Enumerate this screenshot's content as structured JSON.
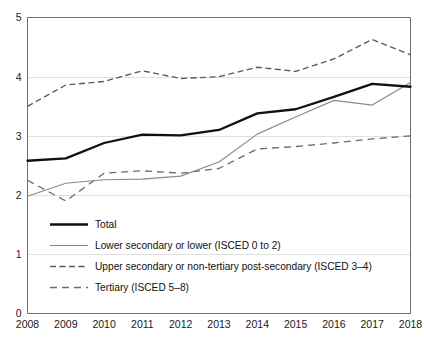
{
  "chart_data": {
    "type": "line",
    "title": "",
    "subtitle": "",
    "xlabel": "",
    "ylabel": "",
    "x": [
      2008,
      2009,
      2010,
      2011,
      2012,
      2013,
      2014,
      2015,
      2016,
      2017,
      2018
    ],
    "xtick_labels": [
      "2008",
      "2009",
      "2010",
      "2011",
      "2012",
      "2013",
      "2014",
      "2015",
      "2016",
      "2017",
      "2018"
    ],
    "ytick_labels": [
      "0",
      "1",
      "2",
      "3",
      "4",
      "5"
    ],
    "yticks": [
      0,
      1,
      2,
      3,
      4,
      5
    ],
    "xlim": [
      2008,
      2018
    ],
    "ylim": [
      0,
      5
    ],
    "grid": "horizontal",
    "legend_position": "lower-left-inside",
    "series": [
      {
        "name": "Total",
        "style": "solid-thick",
        "color": "#111111",
        "values": [
          2.58,
          2.62,
          2.88,
          3.02,
          3.01,
          3.1,
          3.38,
          3.45,
          3.66,
          3.88,
          3.83
        ]
      },
      {
        "name": "Lower secondary or lower (ISCED 0 to 2)",
        "style": "solid-thin",
        "color": "#8a8a8a",
        "values": [
          1.98,
          2.2,
          2.26,
          2.27,
          2.32,
          2.56,
          3.03,
          3.32,
          3.6,
          3.52,
          3.9
        ]
      },
      {
        "name": "Upper secondary or non-tertiary post-secondary (ISCED 3–4)",
        "style": "dashed",
        "color": "#5a5a5a",
        "values": [
          3.5,
          3.86,
          3.92,
          4.1,
          3.97,
          4.0,
          4.16,
          4.09,
          4.3,
          4.63,
          4.37
        ]
      },
      {
        "name": "Tertiary (ISCED 5–8)",
        "style": "dashed-long",
        "color": "#6b6b6b",
        "values": [
          2.25,
          1.9,
          2.37,
          2.41,
          2.37,
          2.45,
          2.78,
          2.82,
          2.88,
          2.95,
          3.0
        ]
      }
    ]
  },
  "legend": {
    "items": [
      {
        "label": "Total"
      },
      {
        "label": "Lower secondary or lower (ISCED 0 to 2)"
      },
      {
        "label": "Upper secondary or non-tertiary post-secondary (ISCED 3–4)"
      },
      {
        "label": "Tertiary (ISCED 5–8)"
      }
    ]
  }
}
